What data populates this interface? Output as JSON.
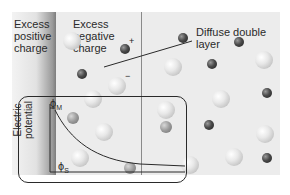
{
  "diagram": {
    "labels": {
      "excess_positive": "Excess\npositive\ncharge",
      "excess_negative": "Excess\nnegative\ncharge",
      "diffuse_layer": "Diffuse double\nlayer",
      "plus_sign": "+",
      "minus_sign": "−"
    },
    "inset_plot": {
      "y_axis_label": "Electric\npotential",
      "phi_m": "ϕM",
      "phi_m_symbol": "ϕ",
      "phi_m_sub": "M",
      "phi_s_symbol": "ϕ",
      "phi_s_sub": "S",
      "curve": "exponential decay from ϕM to ϕS"
    },
    "colors": {
      "panel": "#ececec",
      "electrode_gradient_dark": "#7d7d7d",
      "line": "#2a2a2a"
    }
  }
}
